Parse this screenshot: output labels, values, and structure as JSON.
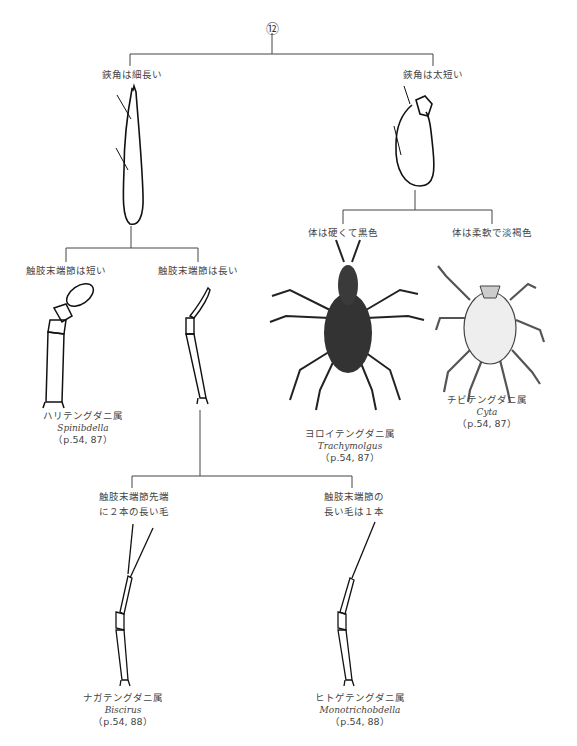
{
  "header": {
    "partial_text": "…属への検索",
    "page_num": "13"
  },
  "root": {
    "node": "⑫"
  },
  "branches": {
    "left": {
      "label": "鋏角は細長い"
    },
    "right": {
      "label": "鋏角は太短い"
    },
    "left_a": {
      "label": "触肢末端節は短い"
    },
    "left_b": {
      "label": "触肢末端節は長い"
    },
    "right_a": {
      "label": "体は硬くて黒色"
    },
    "right_b": {
      "label": "体は柔軟で淡褐色"
    },
    "lb_1": {
      "label_line1": "触肢末端節先端",
      "label_line2": "に２本の長い毛"
    },
    "lb_2": {
      "label_line1": "触肢末端節の",
      "label_line2": "長い毛は１本"
    }
  },
  "taxa": [
    {
      "jp": "ハリテングダニ属",
      "sci": "Spinibdella",
      "page": "（p.54, 87）"
    },
    {
      "jp": "ヨロイテングダニ属",
      "sci": "Trachymolgus",
      "page": "（p.54, 87）"
    },
    {
      "jp": "チビテングダニ属",
      "sci": "Cyta",
      "page": "（p.54, 87）"
    },
    {
      "jp": "ナガテングダニ属",
      "sci": "Biscirus",
      "page": "（p.54, 88）"
    },
    {
      "jp": "ヒトゲテングダニ属",
      "sci": "Monotrichobdella",
      "page": "（p.54, 88）"
    }
  ]
}
